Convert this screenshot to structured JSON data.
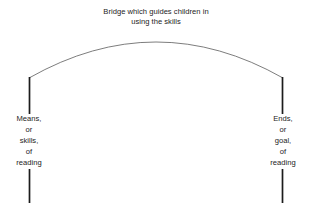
{
  "diagram": {
    "caption": {
      "line1": "Bridge which guides children in",
      "line2": "using the skills"
    },
    "left_pier": {
      "line1": "Means,",
      "line2": "or",
      "line3": "skills,",
      "line4": "of",
      "line5": "reading"
    },
    "right_pier": {
      "line1": "Ends,",
      "line2": "or",
      "line3": "goal,",
      "line4": "of",
      "line5": "reading"
    },
    "colors": {
      "background": "#ffffff",
      "arc_stroke": "#6e6e6e",
      "pier_stroke": "#1c1c1c",
      "text": "#242424"
    }
  }
}
